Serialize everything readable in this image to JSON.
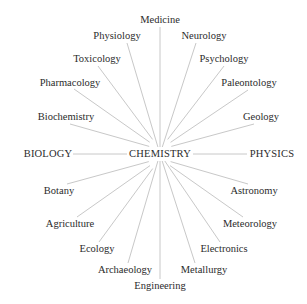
{
  "diagram": {
    "center": {
      "label": "CHEMISTRY",
      "x": 160,
      "y": 154
    },
    "line_color": "#c8c8c8",
    "text_color": "#2b2b2b",
    "nodes": [
      {
        "label": "Medicine",
        "x": 160,
        "y": 20,
        "ax": 160,
        "ay": 27
      },
      {
        "label": "Physiology",
        "x": 117,
        "y": 36,
        "ax": 127,
        "ay": 43
      },
      {
        "label": "Neurology",
        "x": 204,
        "y": 36,
        "ax": 196,
        "ay": 43
      },
      {
        "label": "Toxicology",
        "x": 97,
        "y": 59,
        "ax": 98,
        "ay": 66
      },
      {
        "label": "Psychology",
        "x": 224,
        "y": 59,
        "ax": 224,
        "ay": 66
      },
      {
        "label": "Pharmacology",
        "x": 70,
        "y": 83,
        "ax": 74,
        "ay": 89
      },
      {
        "label": "Paleontology",
        "x": 249,
        "y": 83,
        "ax": 248,
        "ay": 90
      },
      {
        "label": "Biochemistry",
        "x": 66,
        "y": 117,
        "ax": 70,
        "ay": 124
      },
      {
        "label": "Geology",
        "x": 261,
        "y": 117,
        "ax": 254,
        "ay": 124
      },
      {
        "label": "BIOLOGY",
        "x": 48,
        "y": 154,
        "ax": 73,
        "ay": 154
      },
      {
        "label": "PHYSICS",
        "x": 272,
        "y": 154,
        "ax": 247,
        "ay": 154
      },
      {
        "label": "Botany",
        "x": 59,
        "y": 191,
        "ax": 67,
        "ay": 184
      },
      {
        "label": "Astronomy",
        "x": 254,
        "y": 191,
        "ax": 248,
        "ay": 184
      },
      {
        "label": "Agriculture",
        "x": 70,
        "y": 224,
        "ax": 77,
        "ay": 217
      },
      {
        "label": "Meteorology",
        "x": 250,
        "y": 224,
        "ax": 243,
        "ay": 217
      },
      {
        "label": "Ecology",
        "x": 97,
        "y": 249,
        "ax": 99,
        "ay": 242
      },
      {
        "label": "Electronics",
        "x": 224,
        "y": 249,
        "ax": 220,
        "ay": 242
      },
      {
        "label": "Archaeology",
        "x": 125,
        "y": 270,
        "ax": 128,
        "ay": 263
      },
      {
        "label": "Metallurgy",
        "x": 204,
        "y": 270,
        "ax": 195,
        "ay": 263
      },
      {
        "label": "Engineering",
        "x": 160,
        "y": 286,
        "ax": 160,
        "ay": 279
      }
    ]
  }
}
